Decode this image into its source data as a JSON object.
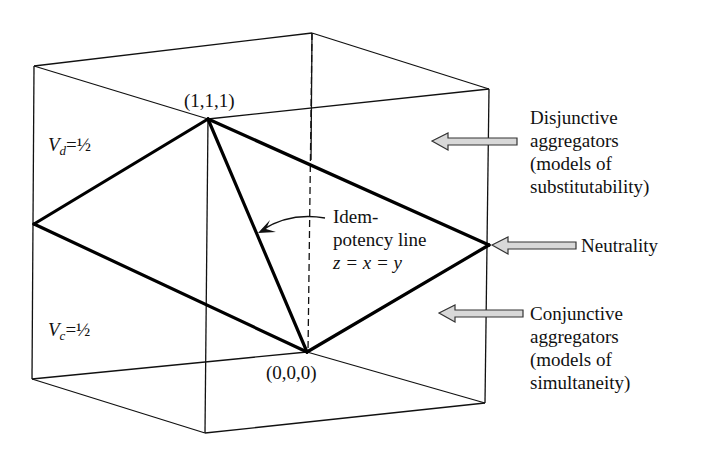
{
  "figure": {
    "vertex_top": "(1,1,1)",
    "vertex_bottom": "(0,0,0)",
    "vd_label": {
      "var": "V",
      "sub": "d",
      "rest": "=½"
    },
    "vc_label": {
      "var": "V",
      "sub": "c",
      "rest": "=½"
    },
    "idempotency": {
      "line1": "Idem-",
      "line2": "potency line",
      "line3": "z = x = y"
    },
    "disjunctive": {
      "line1": "Disjunctive",
      "line2": "aggregators",
      "line3": "(models of",
      "line4": "substitutability)"
    },
    "neutrality": "Neutrality",
    "conjunctive": {
      "line1": "Conjunctive",
      "line2": "aggregators",
      "line3": "(models of",
      "line4": "simultaneity)"
    },
    "colors": {
      "line": "#111111",
      "arrow_fill": "#d8d8d8",
      "arrow_stroke": "#333333"
    }
  }
}
